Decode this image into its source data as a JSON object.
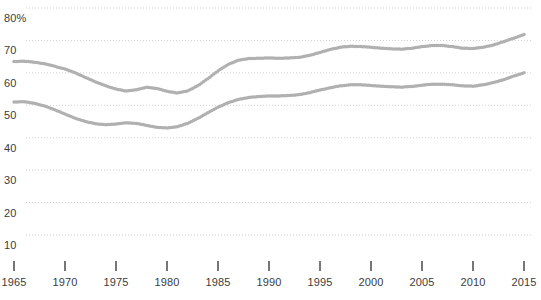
{
  "chart_data": {
    "type": "line",
    "title": "",
    "subtitle": "",
    "xlabel": "",
    "ylabel": "",
    "style": "dotted-marker-line",
    "grid": true,
    "grid_style": "dotted-horizontal",
    "legend": "none",
    "xlim": [
      1965,
      2015
    ],
    "ylim": [
      0,
      80
    ],
    "yticks": [
      10,
      20,
      30,
      40,
      50,
      60,
      70,
      80
    ],
    "ytick_labels": [
      "10",
      "20",
      "30",
      "40",
      "50",
      "60",
      "70",
      "80%"
    ],
    "xticks": [
      1965,
      1970,
      1975,
      1980,
      1985,
      1990,
      1995,
      2000,
      2005,
      2010,
      2015
    ],
    "xtick_labels": [
      "1965",
      "1970",
      "1975",
      "1980",
      "1985",
      "1990",
      "1995",
      "2000",
      "2005",
      "2010",
      "2015"
    ],
    "marker_color": "#b0b0b0",
    "axis_color": "#3c3c3c",
    "grid_color": "#cfcfcf",
    "x": [
      1965,
      1966,
      1967,
      1968,
      1969,
      1970,
      1971,
      1972,
      1973,
      1974,
      1975,
      1976,
      1977,
      1978,
      1979,
      1980,
      1981,
      1982,
      1983,
      1984,
      1985,
      1986,
      1987,
      1988,
      1989,
      1990,
      1991,
      1992,
      1993,
      1994,
      1995,
      1996,
      1997,
      1998,
      1999,
      2000,
      2001,
      2002,
      2003,
      2004,
      2005,
      2006,
      2007,
      2008,
      2009,
      2010,
      2011,
      2012,
      2013,
      2014,
      2015
    ],
    "series": [
      {
        "name": "upper-series",
        "values": [
          63.5,
          63.6,
          63.3,
          62.8,
          62.0,
          61.2,
          60.0,
          58.6,
          57.2,
          56.0,
          55.0,
          54.4,
          54.8,
          55.6,
          55.2,
          54.3,
          53.8,
          54.4,
          56.0,
          58.2,
          60.6,
          62.6,
          63.9,
          64.4,
          64.5,
          64.6,
          64.5,
          64.6,
          64.8,
          65.4,
          66.3,
          67.2,
          67.9,
          68.2,
          68.1,
          67.9,
          67.6,
          67.4,
          67.3,
          67.6,
          68.1,
          68.4,
          68.4,
          68.1,
          67.6,
          67.5,
          67.9,
          68.6,
          69.6,
          70.7,
          71.8
        ]
      },
      {
        "name": "lower-series",
        "values": [
          51.0,
          51.1,
          50.6,
          49.8,
          48.6,
          47.3,
          46.0,
          45.0,
          44.3,
          44.0,
          44.2,
          44.6,
          44.4,
          43.8,
          43.2,
          43.0,
          43.4,
          44.4,
          45.9,
          47.7,
          49.4,
          50.8,
          51.8,
          52.4,
          52.7,
          52.9,
          52.9,
          53.0,
          53.3,
          53.9,
          54.7,
          55.4,
          56.0,
          56.3,
          56.3,
          56.1,
          55.9,
          55.7,
          55.6,
          55.8,
          56.2,
          56.5,
          56.5,
          56.3,
          56.0,
          55.9,
          56.3,
          57.0,
          57.9,
          59.0,
          60.0
        ]
      }
    ]
  }
}
